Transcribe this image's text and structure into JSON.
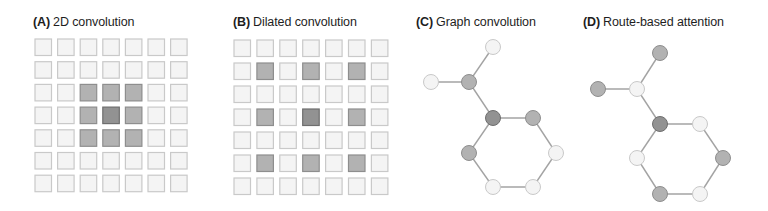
{
  "figure": {
    "panels": [
      {
        "id": "A",
        "label": "(A)",
        "title": "2D convolution",
        "kind": "grid",
        "rows": 7,
        "cols": 7,
        "highlighted": [
          {
            "row": 2,
            "col": 2,
            "level": "selected"
          },
          {
            "row": 2,
            "col": 3,
            "level": "selected"
          },
          {
            "row": 2,
            "col": 4,
            "level": "selected"
          },
          {
            "row": 3,
            "col": 2,
            "level": "selected"
          },
          {
            "row": 3,
            "col": 3,
            "level": "center"
          },
          {
            "row": 3,
            "col": 4,
            "level": "selected"
          },
          {
            "row": 4,
            "col": 2,
            "level": "selected"
          },
          {
            "row": 4,
            "col": 3,
            "level": "selected"
          },
          {
            "row": 4,
            "col": 4,
            "level": "selected"
          }
        ]
      },
      {
        "id": "B",
        "label": "(B)",
        "title": "Dilated convolution",
        "kind": "grid",
        "rows": 7,
        "cols": 7,
        "highlighted": [
          {
            "row": 1,
            "col": 1,
            "level": "selected"
          },
          {
            "row": 1,
            "col": 3,
            "level": "selected"
          },
          {
            "row": 1,
            "col": 5,
            "level": "selected"
          },
          {
            "row": 3,
            "col": 1,
            "level": "selected"
          },
          {
            "row": 3,
            "col": 3,
            "level": "center"
          },
          {
            "row": 3,
            "col": 5,
            "level": "selected"
          },
          {
            "row": 5,
            "col": 1,
            "level": "selected"
          },
          {
            "row": 5,
            "col": 3,
            "level": "selected"
          },
          {
            "row": 5,
            "col": 5,
            "level": "selected"
          }
        ]
      },
      {
        "id": "C",
        "label": "(C)",
        "title": "Graph convolution",
        "kind": "graph",
        "nodes": [
          {
            "id": "top",
            "level": "none"
          },
          {
            "id": "left",
            "level": "none"
          },
          {
            "id": "branch",
            "level": "selected"
          },
          {
            "id": "center",
            "level": "center"
          },
          {
            "id": "ring-upper-right",
            "level": "selected"
          },
          {
            "id": "ring-lower-left",
            "level": "selected"
          },
          {
            "id": "ring-lower-right",
            "level": "none"
          },
          {
            "id": "ring-bottom-left",
            "level": "none"
          },
          {
            "id": "ring-bottom-right",
            "level": "none"
          }
        ]
      },
      {
        "id": "D",
        "label": "(D)",
        "title": "Route-based attention",
        "kind": "graph",
        "nodes": [
          {
            "id": "top",
            "level": "selected"
          },
          {
            "id": "left",
            "level": "selected"
          },
          {
            "id": "branch",
            "level": "none"
          },
          {
            "id": "center",
            "level": "center"
          },
          {
            "id": "ring-upper-right",
            "level": "none"
          },
          {
            "id": "ring-lower-left",
            "level": "none"
          },
          {
            "id": "ring-lower-right",
            "level": "selected"
          },
          {
            "id": "ring-bottom-left",
            "level": "selected"
          },
          {
            "id": "ring-bottom-right",
            "level": "none"
          }
        ]
      }
    ],
    "graph_edges": [
      [
        "top",
        "branch"
      ],
      [
        "left",
        "branch"
      ],
      [
        "branch",
        "center"
      ],
      [
        "center",
        "ring-upper-right"
      ],
      [
        "ring-upper-right",
        "ring-lower-right"
      ],
      [
        "ring-lower-right",
        "ring-bottom-right"
      ],
      [
        "ring-bottom-right",
        "ring-bottom-left"
      ],
      [
        "ring-bottom-left",
        "ring-lower-left"
      ],
      [
        "ring-lower-left",
        "center"
      ]
    ],
    "colors": {
      "none_fill": "#f4f4f4",
      "none_stroke": "#c9c9c9",
      "selected_fill": "#b2b2b2",
      "selected_stroke": "#8e8e8e",
      "center_fill": "#929292",
      "center_stroke": "#6e6e6e",
      "edge": "#a3a3a3"
    }
  }
}
